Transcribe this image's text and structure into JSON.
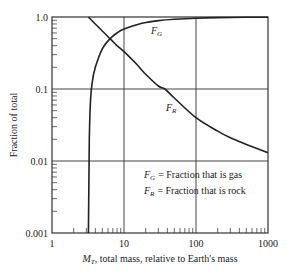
{
  "chart_data": {
    "type": "line",
    "title": "",
    "xlabel": "M_T, total mass, relative to Earth's mass",
    "xlabel_parts": {
      "symbol": "M",
      "sub": "T",
      "rest": ", total mass, relative to Earth's mass"
    },
    "ylabel": "Fraction of total",
    "xscale": "log",
    "yscale": "log",
    "xlim": [
      1,
      1000
    ],
    "ylim": [
      0.001,
      1.0
    ],
    "grid": true,
    "x_tick_labels": [
      "1",
      "10",
      "100",
      "1000"
    ],
    "x_ticks": [
      1,
      10,
      100,
      1000
    ],
    "y_tick_labels": [
      "1.0",
      "0.1",
      "0.01",
      "0.001"
    ],
    "y_ticks": [
      1.0,
      0.1,
      0.01,
      0.001
    ],
    "series": [
      {
        "name": "F_G",
        "label": "F",
        "label_sub": "G",
        "description": "Fraction that is gas",
        "x": [
          3.2,
          3.25,
          3.3,
          3.4,
          3.6,
          4.0,
          5.0,
          6.4,
          8.0,
          10,
          15,
          20,
          30,
          50,
          100,
          200,
          500,
          1000
        ],
        "values": [
          0.001,
          0.005,
          0.02,
          0.06,
          0.12,
          0.2,
          0.36,
          0.5,
          0.6,
          0.68,
          0.78,
          0.84,
          0.89,
          0.93,
          0.96,
          0.98,
          0.99,
          0.995
        ]
      },
      {
        "name": "F_R",
        "label": "F",
        "label_sub": "R",
        "description": "Fraction that is rock",
        "x": [
          3.2,
          4.0,
          5.0,
          6.4,
          8.0,
          10,
          15,
          20,
          30,
          37,
          50,
          100,
          200,
          300,
          500,
          1000
        ],
        "values": [
          1.0,
          0.8,
          0.64,
          0.5,
          0.4,
          0.33,
          0.22,
          0.16,
          0.11,
          0.1,
          0.075,
          0.04,
          0.026,
          0.021,
          0.017,
          0.013
        ]
      }
    ],
    "legend": {
      "position": "inside lower right",
      "entries": [
        {
          "symbol": "F",
          "sub": "G",
          "text": "= Fraction that is gas"
        },
        {
          "symbol": "F",
          "sub": "R",
          "text": "= Fraction that is rock"
        }
      ]
    },
    "annotations": [
      {
        "text": "F_G",
        "x": 30,
        "y": 0.75
      },
      {
        "text": "F_R",
        "x": 30,
        "y": 0.055
      }
    ]
  }
}
